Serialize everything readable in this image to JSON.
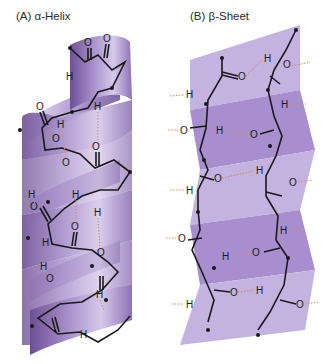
{
  "panels": {
    "a": {
      "label": "(A) α-Helix",
      "structure": "alpha-helix",
      "ribbon_color": "#9b7fc0",
      "ribbon_dark": "#6e4f96",
      "ribbon_light": "#d4c6e8"
    },
    "b": {
      "label": "(B) β-Sheet",
      "structure": "beta-sheet",
      "sheet_light": "#c9b8e2",
      "sheet_mid": "#b39bd6",
      "sheet_dark": "#9a7fc2"
    }
  },
  "atoms": {
    "oxygen": "O",
    "hydrogen": "H"
  },
  "colors": {
    "backbone": "#1a1a1a",
    "hbond": "#d98a5a"
  }
}
